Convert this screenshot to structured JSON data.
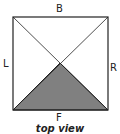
{
  "diagram": {
    "labels": {
      "back": "B",
      "left": "L",
      "right": "R",
      "front": "F"
    },
    "caption": "top view",
    "shaded_region": "front triangle",
    "colors": {
      "stroke": "#222222",
      "fill": "#808080",
      "background": "#ffffff"
    }
  }
}
